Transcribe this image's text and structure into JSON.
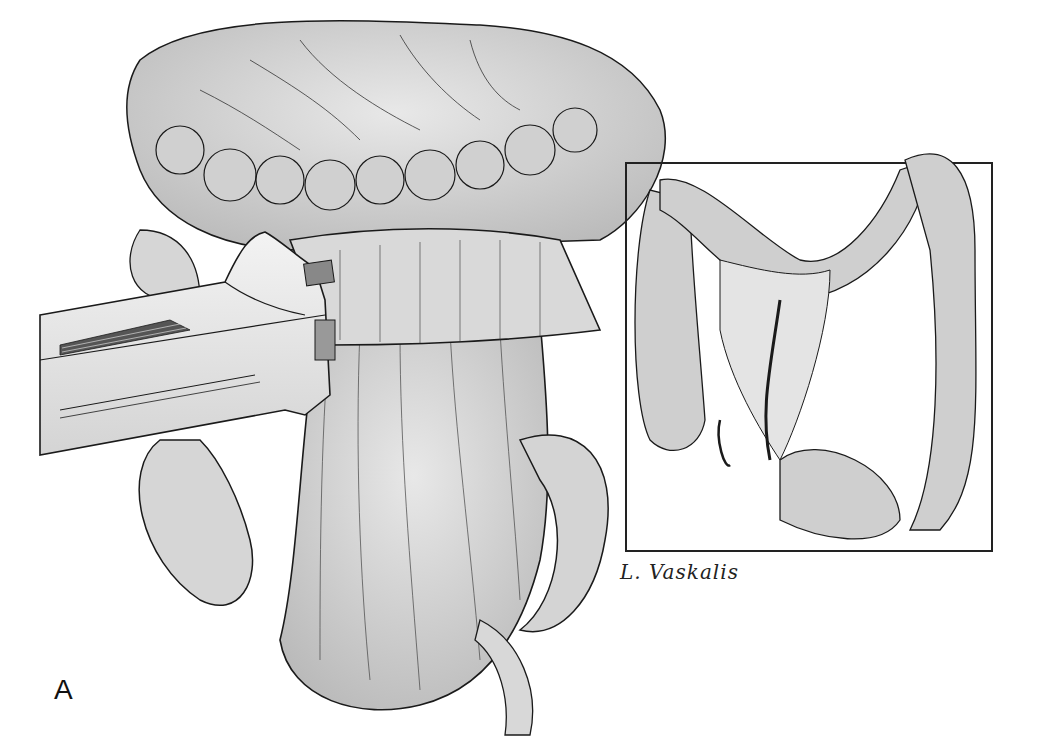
{
  "figure": {
    "panel_label": "A",
    "signature": "L. Vaskalis"
  },
  "colors": {
    "background": "#ffffff",
    "tissue_fill": "#cfcfcf",
    "tissue_light": "#e6e6e6",
    "line": "#1a1a1a",
    "instrument_fill": "#ececec"
  }
}
